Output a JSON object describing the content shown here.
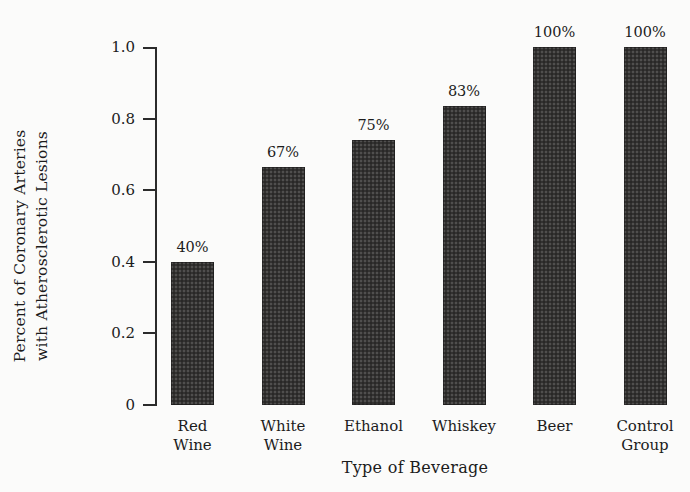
{
  "chart_data": {
    "type": "bar",
    "title": "",
    "xlabel": "Type of Beverage",
    "ylabel_line1": "Percent of Coronary Arteries",
    "ylabel_line2": "with Atherosclerotic Lesions",
    "categories": [
      "Red Wine",
      "White Wine",
      "Ethanol",
      "Whiskey",
      "Beer",
      "Control Group"
    ],
    "category_lines": [
      [
        "Red",
        "Wine"
      ],
      [
        "White",
        "Wine"
      ],
      [
        "Ethanol"
      ],
      [
        "Whiskey"
      ],
      [
        "Beer"
      ],
      [
        "Control",
        "Group"
      ]
    ],
    "values": [
      0.4,
      0.665,
      0.74,
      0.835,
      1.0,
      1.0
    ],
    "data_labels": [
      "40%",
      "67%",
      "75%",
      "83%",
      "100%",
      "100%"
    ],
    "ylim": [
      0,
      1.0
    ],
    "ytick_values": [
      0,
      0.2,
      0.4,
      0.6,
      0.8,
      1.0
    ],
    "ytick_labels": [
      "0",
      "0.2",
      "0.4",
      "0.6",
      "0.8",
      "1.0"
    ],
    "grid": false,
    "legend": false,
    "bar_color": "#333231",
    "axis_color": "#2b2b2b",
    "background_color": "#fbfbfa"
  },
  "geometry": {
    "axis_x": 155,
    "y_top": 47,
    "y_bottom": 405,
    "bar_width": 43,
    "bar_pitch": 90.5,
    "first_bar_left": 171,
    "label_top": 417
  }
}
